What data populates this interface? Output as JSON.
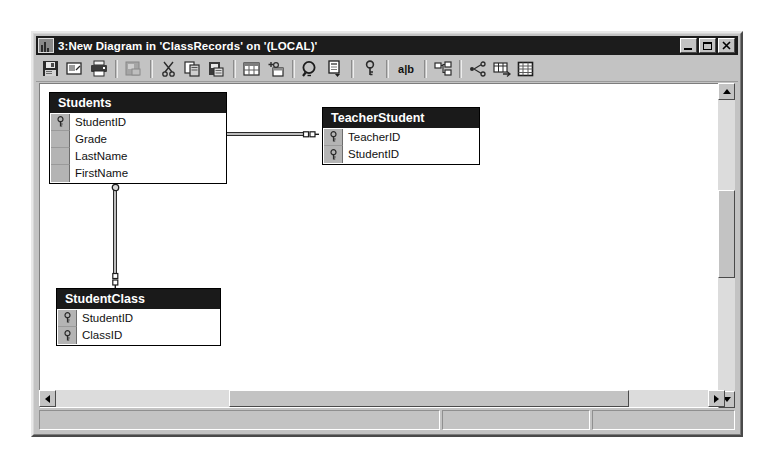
{
  "window": {
    "title": "3:New Diagram in 'ClassRecords' on '(LOCAL)'",
    "icon": "diagram-window-icon",
    "controls": {
      "minimize_label": "_",
      "maximize_label": "□",
      "close_label": "✕"
    }
  },
  "toolbar": {
    "buttons": [
      {
        "name": "save-button",
        "icon": "floppy-disk-icon",
        "label": ""
      },
      {
        "name": "new-table-button",
        "icon": "new-table-icon",
        "label": ""
      },
      {
        "name": "print-button",
        "icon": "printer-icon",
        "label": ""
      },
      {
        "name": "save-selection-button",
        "icon": "save-selection-icon",
        "label": ""
      },
      {
        "name": "cut-button",
        "icon": "scissors-icon",
        "label": ""
      },
      {
        "name": "copy-button",
        "icon": "copy-icon",
        "label": ""
      },
      {
        "name": "paste-button",
        "icon": "paste-icon",
        "label": ""
      },
      {
        "name": "add-table-button",
        "icon": "grid-table-icon",
        "label": ""
      },
      {
        "name": "new-text-annotation-button",
        "icon": "add-annotation-icon",
        "label": ""
      },
      {
        "name": "zoom-button",
        "icon": "magnifier-icon",
        "label": ""
      },
      {
        "name": "properties-button",
        "icon": "properties-page-icon",
        "label": ""
      },
      {
        "name": "set-primary-key-button",
        "icon": "key-icon",
        "label": ""
      },
      {
        "name": "column-names-button",
        "icon": "ab-text-icon",
        "label": "a|b"
      },
      {
        "name": "relationships-button",
        "icon": "relationships-icon",
        "label": ""
      },
      {
        "name": "show-relationship-labels-button",
        "icon": "relationship-labels-icon",
        "label": ""
      },
      {
        "name": "table-view-button",
        "icon": "table-view-icon",
        "label": ""
      },
      {
        "name": "column-properties-button",
        "icon": "column-properties-icon",
        "label": ""
      }
    ]
  },
  "diagram": {
    "tables": [
      {
        "name": "Students",
        "x": 155,
        "y": 118,
        "width": 178,
        "columns": [
          {
            "name": "StudentID",
            "primary_key": true
          },
          {
            "name": "Grade",
            "primary_key": false
          },
          {
            "name": "LastName",
            "primary_key": false
          },
          {
            "name": "FirstName",
            "primary_key": false
          }
        ]
      },
      {
        "name": "TeacherStudent",
        "x": 428,
        "y": 133,
        "width": 158,
        "columns": [
          {
            "name": "TeacherID",
            "primary_key": true
          },
          {
            "name": "StudentID",
            "primary_key": true
          }
        ]
      },
      {
        "name": "StudentClass",
        "x": 162,
        "y": 314,
        "width": 165,
        "columns": [
          {
            "name": "StudentID",
            "primary_key": true
          },
          {
            "name": "ClassID",
            "primary_key": true
          }
        ]
      }
    ],
    "relationships": [
      {
        "name": "students-to-teacherstudent",
        "from": "Students",
        "to": "TeacherStudent",
        "from_cardinality": "one",
        "to_cardinality": "many",
        "orientation": "horizontal"
      },
      {
        "name": "students-to-studentclass",
        "from": "Students",
        "to": "StudentClass",
        "from_cardinality": "one",
        "to_cardinality": "many",
        "orientation": "vertical"
      }
    ]
  },
  "scrollbars": {
    "vertical": {
      "up_arrow": "▲",
      "down_arrow": "▼",
      "thumb_top_pct": 33,
      "thumb_height_pct": 27
    },
    "horizontal": {
      "left_arrow": "◄",
      "right_arrow": "►",
      "thumb_left_pct": 26,
      "thumb_width_pct": 60
    }
  },
  "statusbar": {
    "panel1": "",
    "panel2": "",
    "panel3": ""
  }
}
